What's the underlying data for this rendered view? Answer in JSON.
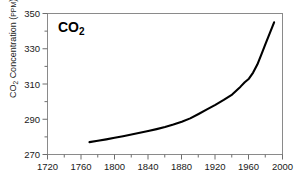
{
  "chart_data": {
    "type": "line",
    "title": "",
    "annotation": "CO2",
    "annotation_base": "CO",
    "annotation_sub": "2",
    "xlabel": "",
    "ylabel": "CO2 Concentration (PPM)",
    "ylabel_base": "CO",
    "ylabel_sub": "2",
    "ylabel_rest": " Concentration (",
    "ylabel_unit": "PPM",
    "ylabel_close": ")",
    "xlim": [
      1720,
      2000
    ],
    "ylim": [
      270,
      350
    ],
    "xticks": [
      1720,
      1760,
      1800,
      1840,
      1880,
      1920,
      1960,
      2000
    ],
    "xtick_labels": [
      "1720",
      "1760",
      "1800",
      "1840",
      "1880",
      "1920",
      "1960",
      "2000"
    ],
    "xminor_ticks": [
      1740,
      1780,
      1820,
      1860,
      1900,
      1940,
      1980
    ],
    "yticks": [
      270,
      290,
      310,
      330,
      350
    ],
    "ytick_labels": [
      "270",
      "290",
      "310",
      "330",
      "350"
    ],
    "yminor_ticks": [
      280,
      300,
      320,
      340
    ],
    "grid": false,
    "legend": "none",
    "line_color": "#000000",
    "frame_color": "#8a8a8a",
    "background_color": "#ffffff",
    "series": [
      {
        "name": "CO2 Concentration",
        "x": [
          1770,
          1780,
          1790,
          1800,
          1810,
          1820,
          1830,
          1840,
          1850,
          1860,
          1870,
          1880,
          1890,
          1900,
          1910,
          1920,
          1930,
          1940,
          1950,
          1955,
          1960,
          1965,
          1970,
          1975,
          1980,
          1985,
          1990
        ],
        "y": [
          277.0,
          277.8,
          278.6,
          279.5,
          280.4,
          281.3,
          282.3,
          283.3,
          284.4,
          285.6,
          287.0,
          288.6,
          290.5,
          293.0,
          295.6,
          298.2,
          301.0,
          304.0,
          308.5,
          311.0,
          313.0,
          316.5,
          321.0,
          327.0,
          333.0,
          339.0,
          345.0
        ]
      }
    ]
  }
}
